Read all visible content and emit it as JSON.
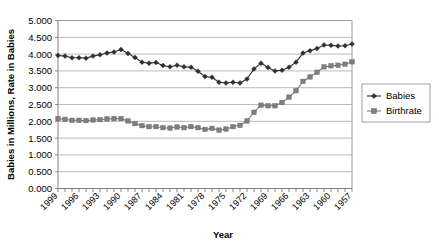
{
  "chart_data": {
    "type": "line",
    "title": "",
    "xlabel": "Year",
    "ylabel": "Babies in Millions, Rate in Babies",
    "grid": true,
    "legend_position": "right",
    "ylim": [
      0.0,
      5.0
    ],
    "ytick_step": 0.5,
    "ytick_labels": [
      "5.000",
      "4.500",
      "4.000",
      "3.500",
      "3.000",
      "2.500",
      "2.000",
      "1.500",
      "1.000",
      "0.500",
      "0.000"
    ],
    "ytick_values": [
      5.0,
      4.5,
      4.0,
      3.5,
      3.0,
      2.5,
      2.0,
      1.5,
      1.0,
      0.5,
      0.0
    ],
    "x_axis_order": "descending",
    "x": [
      1999,
      1998,
      1997,
      1996,
      1995,
      1994,
      1993,
      1992,
      1991,
      1990,
      1989,
      1988,
      1987,
      1986,
      1985,
      1984,
      1983,
      1982,
      1981,
      1980,
      1979,
      1978,
      1977,
      1976,
      1975,
      1974,
      1973,
      1972,
      1971,
      1970,
      1969,
      1968,
      1967,
      1966,
      1965,
      1964,
      1963,
      1962,
      1961,
      1960,
      1959,
      1958,
      1957
    ],
    "xtick_labels": [
      "1999",
      "1996",
      "1993",
      "1990",
      "1987",
      "1984",
      "1981",
      "1978",
      "1975",
      "1972",
      "1969",
      "1966",
      "1963",
      "1960",
      "1957"
    ],
    "xtick_values": [
      1999,
      1996,
      1993,
      1990,
      1987,
      1984,
      1981,
      1978,
      1975,
      1972,
      1969,
      1966,
      1963,
      1960,
      1957
    ],
    "series": [
      {
        "name": "Babies",
        "marker": "diamond",
        "color": "#303030",
        "values": [
          3.96,
          3.94,
          3.89,
          3.89,
          3.88,
          3.94,
          3.98,
          4.03,
          4.06,
          4.14,
          4.02,
          3.9,
          3.76,
          3.73,
          3.75,
          3.66,
          3.62,
          3.67,
          3.62,
          3.61,
          3.49,
          3.33,
          3.31,
          3.16,
          3.14,
          3.16,
          3.14,
          3.26,
          3.56,
          3.73,
          3.6,
          3.5,
          3.52,
          3.61,
          3.76,
          4.03,
          4.1,
          4.17,
          4.27,
          4.26,
          4.24,
          4.25,
          4.3
        ]
      },
      {
        "name": "Birthrate",
        "marker": "square",
        "color": "#808080",
        "values": [
          2.08,
          2.06,
          2.03,
          2.03,
          2.02,
          2.04,
          2.05,
          2.07,
          2.08,
          2.08,
          2.01,
          1.93,
          1.87,
          1.84,
          1.84,
          1.81,
          1.8,
          1.83,
          1.81,
          1.84,
          1.81,
          1.76,
          1.79,
          1.74,
          1.77,
          1.84,
          1.88,
          2.01,
          2.27,
          2.48,
          2.46,
          2.46,
          2.56,
          2.72,
          2.91,
          3.19,
          3.32,
          3.46,
          3.62,
          3.65,
          3.67,
          3.7,
          3.77
        ]
      }
    ]
  },
  "legend": {
    "items": [
      {
        "label": "Babies"
      },
      {
        "label": "Birthrate"
      }
    ]
  },
  "axes": {
    "x_title": "Year",
    "y_title": "Babies in Millions, Rate in Babies"
  }
}
